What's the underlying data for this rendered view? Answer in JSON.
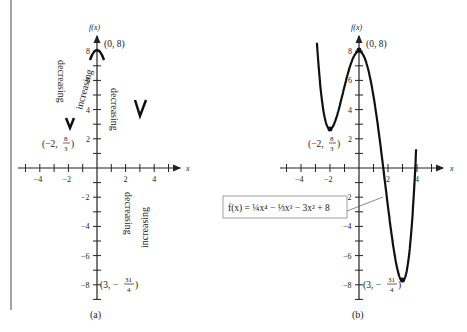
{
  "chart_data": [
    {
      "type": "line",
      "panel": "(a)",
      "ylabel": "f(x)",
      "xlabel": "x",
      "xlim": [
        -5.5,
        5.5
      ],
      "ylim": [
        -9,
        9
      ],
      "xticks": [
        -4,
        -2,
        2,
        4
      ],
      "yticks": [
        8,
        6,
        4,
        2,
        -2,
        -4,
        -6,
        -8
      ],
      "grid": false,
      "points": [
        {
          "label": "(0, 8)",
          "x": 0,
          "y": 8,
          "kind": "relative maximum"
        },
        {
          "label": "(-2, 8/3)",
          "x": -2,
          "y": 2.6667,
          "kind": "relative minimum"
        },
        {
          "label": "(3, -31/4)",
          "x": 3,
          "y": -7.75,
          "kind": "relative minimum"
        }
      ],
      "annotations": [
        "decreasing",
        "increasing",
        "decreasing",
        "decreasing",
        "increasing"
      ]
    },
    {
      "type": "line",
      "panel": "(b)",
      "ylabel": "f(x)",
      "xlabel": "x",
      "xlim": [
        -5.5,
        5.5
      ],
      "ylim": [
        -9,
        9
      ],
      "xticks": [
        -4,
        -2,
        2,
        4
      ],
      "yticks": [
        8,
        6,
        4,
        2,
        -2,
        -4,
        -6,
        -8
      ],
      "grid": false,
      "function": "f(x) = 1/4 x^4 - 1/3 x^3 - 3x^2 + 8",
      "points": [
        {
          "label": "(0, 8)",
          "x": 0,
          "y": 8
        },
        {
          "label": "(-2, 8/3)",
          "x": -2,
          "y": 2.6667
        },
        {
          "label": "(3, -31/4)",
          "x": 3,
          "y": -7.75
        }
      ]
    }
  ],
  "labels": {
    "fx": "f(x)",
    "x": "x",
    "panel_a": "(a)",
    "panel_b": "(b)",
    "max_point": "(0, 8)",
    "min_left_prefix": "(−2,",
    "min_left_num": "8",
    "min_left_den": "3",
    "min_right_prefix": "(3, −",
    "min_right_num": "31",
    "min_right_den": "4",
    "decreasing": "decreasing",
    "increasing": "increasing",
    "formula": "f(x) = ¼x⁴ − ⅓x³ − 3x² + 8"
  }
}
